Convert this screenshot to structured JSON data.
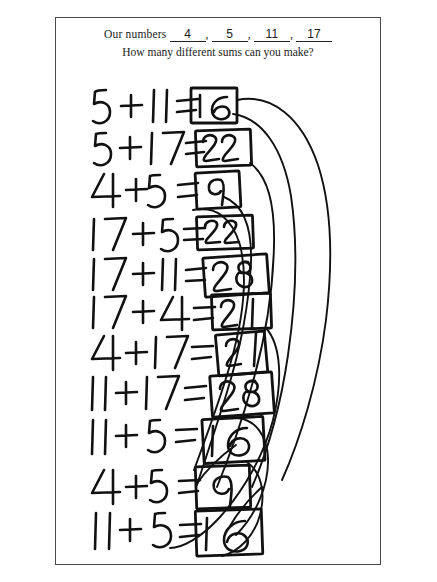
{
  "page": {
    "background_color": "#ffffff",
    "border_color": "#4a4a4a",
    "ink_color": "#111111"
  },
  "header": {
    "label": "Our numbers",
    "numbers": [
      "4",
      "5",
      "11",
      "17"
    ],
    "separator": ",",
    "question": "How many different sums can you make?"
  },
  "work": {
    "equations": [
      {
        "index": 1,
        "left": "5",
        "op": "+",
        "right": "11",
        "eq": "=",
        "sum": "16",
        "boxed": true
      },
      {
        "index": 2,
        "left": "5",
        "op": "+",
        "right": "17",
        "eq": "=",
        "sum": "22",
        "boxed": true
      },
      {
        "index": 3,
        "left": "4",
        "op": "+",
        "right": "5",
        "eq": "=",
        "sum": "9",
        "boxed": true
      },
      {
        "index": 4,
        "left": "17",
        "op": "+",
        "right": "5",
        "eq": "=",
        "sum": "22",
        "boxed": true
      },
      {
        "index": 5,
        "left": "17",
        "op": "+",
        "right": "11",
        "eq": "=",
        "sum": "28",
        "boxed": true
      },
      {
        "index": 6,
        "left": "17",
        "op": "+",
        "right": "4",
        "eq": "=",
        "sum": "21",
        "boxed": true
      },
      {
        "index": 7,
        "left": "4",
        "op": "+",
        "right": "17",
        "eq": "=",
        "sum": "21",
        "boxed": true
      },
      {
        "index": 8,
        "left": "11",
        "op": "+",
        "right": "17",
        "eq": "=",
        "sum": "28",
        "boxed": true
      },
      {
        "index": 9,
        "left": "11",
        "op": "+",
        "right": "5",
        "eq": "=",
        "sum": "16",
        "boxed": true
      },
      {
        "index": 10,
        "left": "4",
        "op": "+",
        "right": "5",
        "eq": "=",
        "sum": "9",
        "boxed": true
      },
      {
        "index": 11,
        "left": "11",
        "op": "+",
        "right": "5",
        "eq": "=",
        "sum": "16",
        "boxed": true
      }
    ],
    "annotation_arcs": 6,
    "annotation_note": "hand-drawn arcs on the right linking duplicate boxed sums"
  }
}
